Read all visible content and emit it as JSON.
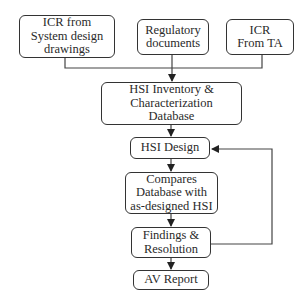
{
  "diagram": {
    "inputs": [
      {
        "id": "icr-system",
        "label": "ICR from\nSystem design\ndrawings"
      },
      {
        "id": "regulatory",
        "label": "Regulatory\ndocuments"
      },
      {
        "id": "icr-ta",
        "label": "ICR\nFrom TA"
      }
    ],
    "steps": [
      {
        "id": "hsi-inventory",
        "label": "HSI Inventory &\nCharacterization\nDatabase"
      },
      {
        "id": "hsi-design",
        "label": "HSI Design"
      },
      {
        "id": "compares",
        "label": "Compares\nDatabase with\nas-designed HSI"
      },
      {
        "id": "findings",
        "label": "Findings &\nResolution"
      },
      {
        "id": "av-report",
        "label": "AV Report"
      }
    ],
    "edges": [
      {
        "from": "icr-system",
        "to": "hsi-inventory"
      },
      {
        "from": "regulatory",
        "to": "hsi-inventory"
      },
      {
        "from": "icr-ta",
        "to": "hsi-inventory"
      },
      {
        "from": "hsi-inventory",
        "to": "hsi-design"
      },
      {
        "from": "hsi-design",
        "to": "compares"
      },
      {
        "from": "compares",
        "to": "findings"
      },
      {
        "from": "findings",
        "to": "av-report"
      },
      {
        "from": "findings",
        "to": "hsi-design",
        "type": "feedback"
      }
    ],
    "colors": {
      "stroke": "#333333",
      "background": "#ffffff",
      "text": "#2a2a2a"
    }
  }
}
